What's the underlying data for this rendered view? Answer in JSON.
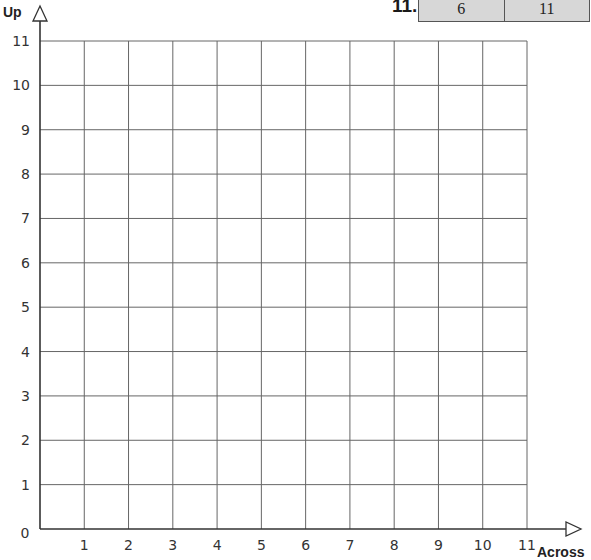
{
  "table_row": {
    "label": "11.",
    "across": "6",
    "up": "11"
  },
  "chart_data": {
    "type": "scatter",
    "title": "",
    "xlabel": "Across",
    "ylabel": "Up",
    "xlim": [
      0,
      11
    ],
    "ylim": [
      0,
      11
    ],
    "x_ticks": [
      "0",
      "1",
      "2",
      "3",
      "4",
      "5",
      "6",
      "7",
      "8",
      "9",
      "10",
      "11"
    ],
    "y_ticks": [
      "0",
      "1",
      "2",
      "3",
      "4",
      "5",
      "6",
      "7",
      "8",
      "9",
      "10",
      "11"
    ],
    "grid": true,
    "points": [],
    "legend": null
  }
}
